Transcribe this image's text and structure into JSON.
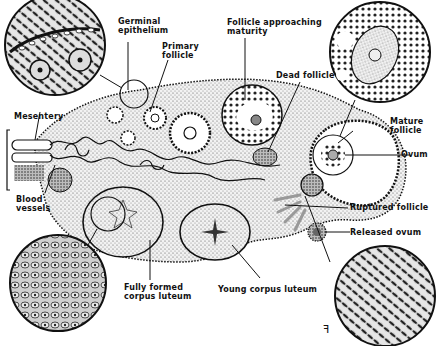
{
  "diagram": {
    "labels": {
      "germinal_epithelium": "Germinal\nepithelium",
      "primary_follicle": "Primary\nfollicle",
      "follicle_approaching_maturity": "Follicle approaching\nmaturity",
      "dead_follicle": "Dead follicle",
      "mesentery": "Mesentery",
      "blood_vessels": "Blood\nvessels",
      "mature_follicle": "Mature\nfollicle",
      "ovum": "Ovum",
      "ruptured_follicle": "Ruptured follicle",
      "released_ovum": "Released ovum",
      "fully_formed_corpus_luteum": "Fully formed\ncorpus luteum",
      "young_corpus_luteum": "Young corpus luteum"
    },
    "insets": [
      {
        "name": "germinal-epithelium-inset",
        "position": "top-left"
      },
      {
        "name": "mature-follicle-inset",
        "position": "top-right"
      },
      {
        "name": "corpus-luteum-inset",
        "position": "bottom-left"
      },
      {
        "name": "stroma-inset",
        "position": "bottom-right"
      }
    ],
    "signature": "ꟻ"
  }
}
